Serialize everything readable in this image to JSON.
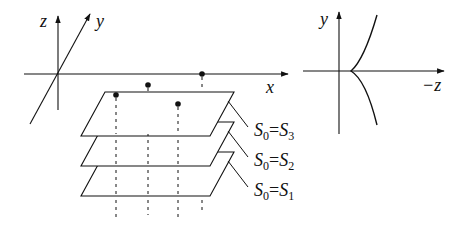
{
  "left_figure": {
    "axes": {
      "z_label": "z",
      "y_label": "y",
      "x_label": "x"
    },
    "points_count": 4,
    "planes": [
      {
        "label_main": "S",
        "label_sub0": "0",
        "eq": "=",
        "label_main2": "S",
        "label_sub": "3"
      },
      {
        "label_main": "S",
        "label_sub0": "0",
        "eq": "=",
        "label_main2": "S",
        "label_sub": "2"
      },
      {
        "label_main": "S",
        "label_sub0": "0",
        "eq": "=",
        "label_main2": "S",
        "label_sub": "1"
      }
    ]
  },
  "right_figure": {
    "axes": {
      "y_label": "y",
      "x_label": "−z"
    },
    "curve": "cusp"
  },
  "colors": {
    "stroke": "#111111",
    "background": "#ffffff"
  }
}
